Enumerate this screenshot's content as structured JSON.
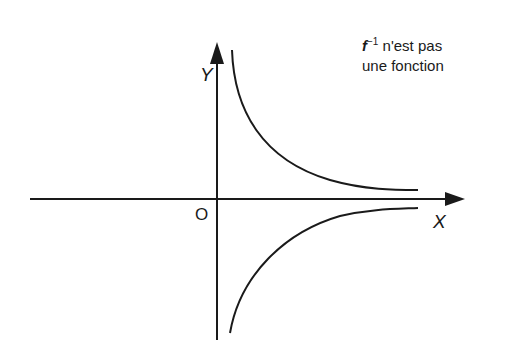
{
  "note": {
    "function_symbol": "f",
    "exponent": "−1",
    "line1_rest": " n'est pas",
    "line2": "une fonction"
  },
  "axes": {
    "x_label": "X",
    "y_label": "Y",
    "origin_label": "O"
  },
  "curves": [
    {
      "name": "upper-branch",
      "description": "decreasing branch above X axis, asymptotic to both axes"
    },
    {
      "name": "lower-branch",
      "description": "mirror branch below X axis, asymptotic to both axes"
    }
  ],
  "colors": {
    "ink": "#1a1a1a",
    "background": "#ffffff"
  }
}
